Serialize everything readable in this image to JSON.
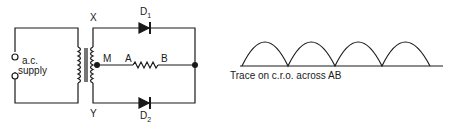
{
  "circuit": {
    "supply_label_line1": "a.c.",
    "supply_label_line2": "supply",
    "terminal_top_label": "X",
    "terminal_bottom_label": "Y",
    "centre_tap_label": "M",
    "diode_top": {
      "label": "D",
      "subscript": "1"
    },
    "diode_bottom": {
      "label": "D",
      "subscript": "2"
    },
    "resistor_left_label": "A",
    "resistor_right_label": "B"
  },
  "trace": {
    "caption": "Trace on c.r.o. across AB",
    "waveform": "full-wave rectified",
    "hump_count": 4
  },
  "colors": {
    "ink": "#1a1a1a",
    "background": "#ffffff"
  }
}
